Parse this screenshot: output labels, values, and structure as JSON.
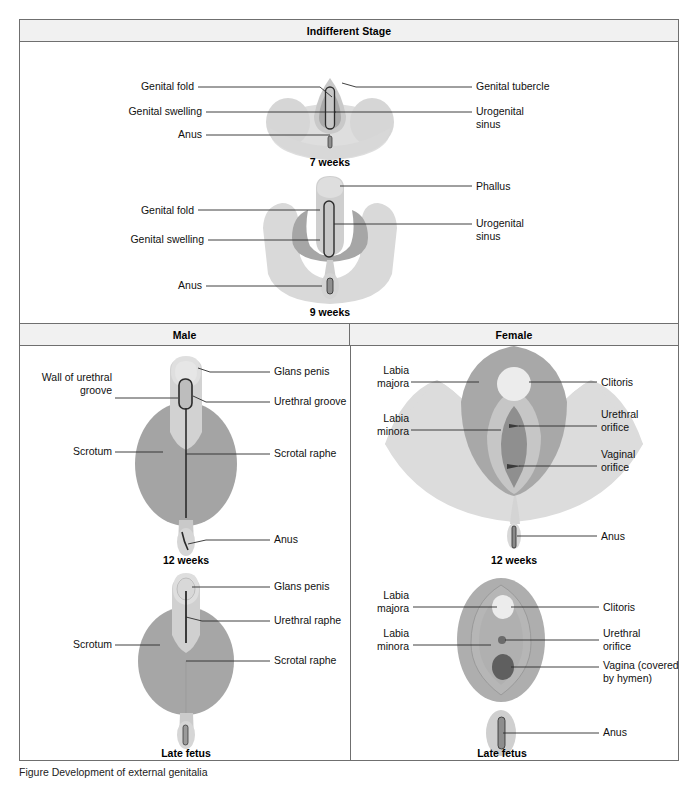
{
  "figure": {
    "headers": {
      "indifferent": "Indifferent Stage",
      "male": "Male",
      "female": "Female"
    },
    "caption": "Figure    Development of external genitalia"
  },
  "colors": {
    "pale": "#dcdcdc",
    "light": "#d2d2d2",
    "mid": "#b8b8b8",
    "dark": "#9a9a9a",
    "darker": "#8a8a8a",
    "outline": "#2b2b2b",
    "header_bg": "#f1f1f1",
    "border": "#6f6f6f"
  },
  "panels": [
    {
      "id": "seven-weeks",
      "stage_caption": "7 weeks",
      "labels_left": [
        {
          "name": "genital-fold",
          "text": "Genital fold"
        },
        {
          "name": "genital-swelling",
          "text": "Genital swelling"
        },
        {
          "name": "anus",
          "text": "Anus"
        }
      ],
      "labels_right": [
        {
          "name": "genital-tubercle",
          "text": "Genital tubercle"
        },
        {
          "name": "urogenital-sinus",
          "text": "Urogenital\nsinus"
        }
      ]
    },
    {
      "id": "nine-weeks",
      "stage_caption": "9 weeks",
      "labels_left": [
        {
          "name": "genital-fold",
          "text": "Genital fold"
        },
        {
          "name": "genital-swelling",
          "text": "Genital swelling"
        },
        {
          "name": "anus",
          "text": "Anus"
        }
      ],
      "labels_right": [
        {
          "name": "phallus",
          "text": "Phallus"
        },
        {
          "name": "urogenital-sinus",
          "text": "Urogenital\nsinus"
        }
      ]
    },
    {
      "id": "male-twelve-weeks",
      "stage_caption": "12 weeks",
      "labels_left": [
        {
          "name": "wall-of-urethral-groove",
          "text": "Wall of urethral\ngroove"
        },
        {
          "name": "scrotum",
          "text": "Scrotum"
        }
      ],
      "labels_right": [
        {
          "name": "glans-penis",
          "text": "Glans penis"
        },
        {
          "name": "urethral-groove",
          "text": "Urethral groove"
        },
        {
          "name": "scrotal-raphe",
          "text": "Scrotal raphe"
        },
        {
          "name": "anus",
          "text": "Anus"
        }
      ]
    },
    {
      "id": "female-twelve-weeks",
      "stage_caption": "12 weeks",
      "labels_left": [
        {
          "name": "labia-majora",
          "text": "Labia\nmajora"
        },
        {
          "name": "labia-minora",
          "text": "Labia\nminora"
        }
      ],
      "labels_right": [
        {
          "name": "clitoris",
          "text": "Clitoris"
        },
        {
          "name": "urethral-orifice",
          "text": "Urethral\norifice"
        },
        {
          "name": "vaginal-orifice",
          "text": "Vaginal\norifice"
        },
        {
          "name": "anus",
          "text": "Anus"
        }
      ]
    },
    {
      "id": "male-late-fetus",
      "stage_caption": "Late fetus",
      "labels_left": [
        {
          "name": "scrotum",
          "text": "Scrotum"
        }
      ],
      "labels_right": [
        {
          "name": "glans-penis",
          "text": "Glans penis"
        },
        {
          "name": "urethral-raphe",
          "text": "Urethral raphe"
        },
        {
          "name": "scrotal-raphe",
          "text": "Scrotal raphe"
        }
      ]
    },
    {
      "id": "female-late-fetus",
      "stage_caption": "Late fetus",
      "labels_left": [
        {
          "name": "labia-majora",
          "text": "Labia\nmajora"
        },
        {
          "name": "labia-minora",
          "text": "Labia\nminora"
        }
      ],
      "labels_right": [
        {
          "name": "clitoris",
          "text": "Clitoris"
        },
        {
          "name": "urethral-orifice",
          "text": "Urethral\norifice"
        },
        {
          "name": "vagina-covered-by-hymen",
          "text": "Vagina (covered\nby hymen)"
        },
        {
          "name": "anus",
          "text": "Anus"
        }
      ]
    }
  ]
}
